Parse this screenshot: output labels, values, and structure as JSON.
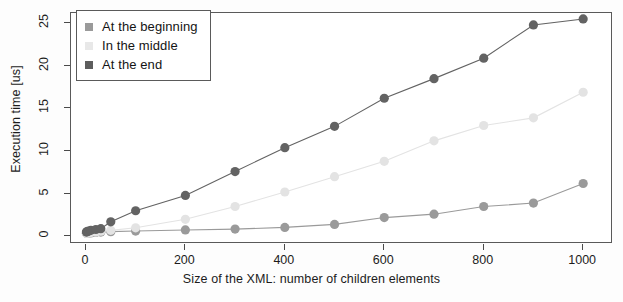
{
  "chart_data": {
    "type": "line",
    "title": "",
    "subtitle": "",
    "xlabel": "Size of the XML: number of children elements",
    "ylabel": "Execution time [us]",
    "xlim": [
      -30,
      1060
    ],
    "ylim": [
      -0.9,
      26.2
    ],
    "xticks": [
      0,
      200,
      400,
      600,
      800,
      1000
    ],
    "yticks": [
      0,
      5,
      10,
      15,
      20,
      25
    ],
    "xticklabels": [
      "0",
      "200",
      "400",
      "600",
      "800",
      "1000"
    ],
    "yticklabels": [
      "0",
      "5",
      "10",
      "15",
      "20",
      "25"
    ],
    "grid": false,
    "legend_position": "upper left",
    "marker": "circle",
    "series": [
      {
        "name": "At the beginning",
        "color": "#9a9a9a",
        "legend_marker": "square",
        "x": [
          1,
          2,
          5,
          10,
          20,
          30,
          50,
          100,
          200,
          300,
          400,
          500,
          600,
          700,
          800,
          900,
          1000
        ],
        "y": [
          0.35,
          0.36,
          0.38,
          0.4,
          0.45,
          0.5,
          0.55,
          0.62,
          0.75,
          0.85,
          1.05,
          1.4,
          2.2,
          2.6,
          3.5,
          3.9,
          6.2
        ]
      },
      {
        "name": "In the middle",
        "color": "#e3e3e3",
        "legend_marker": "square",
        "x": [
          1,
          2,
          5,
          10,
          20,
          30,
          50,
          100,
          200,
          300,
          400,
          500,
          600,
          700,
          800,
          900,
          1000
        ],
        "y": [
          0.35,
          0.37,
          0.4,
          0.45,
          0.5,
          0.6,
          0.7,
          1.0,
          2.0,
          3.5,
          5.2,
          7.0,
          8.8,
          11.2,
          13.0,
          13.9,
          16.9
        ]
      },
      {
        "name": "At the end",
        "color": "#636363",
        "legend_marker": "square",
        "x": [
          1,
          2,
          5,
          10,
          20,
          30,
          50,
          100,
          200,
          300,
          400,
          500,
          600,
          700,
          800,
          900,
          1000
        ],
        "y": [
          0.5,
          0.55,
          0.6,
          0.7,
          0.8,
          0.9,
          1.7,
          3.0,
          4.8,
          7.6,
          10.4,
          12.9,
          16.2,
          18.5,
          20.9,
          24.8,
          25.5
        ]
      }
    ]
  },
  "legend": {
    "items": [
      {
        "label": "At the beginning",
        "color": "#9a9a9a"
      },
      {
        "label": "In the middle",
        "color": "#e8e8e8"
      },
      {
        "label": "At the end",
        "color": "#5d5d5d"
      }
    ]
  },
  "axes": {
    "y_title": "Execution time [us]",
    "x_title": "Size of the XML: number of children elements"
  }
}
